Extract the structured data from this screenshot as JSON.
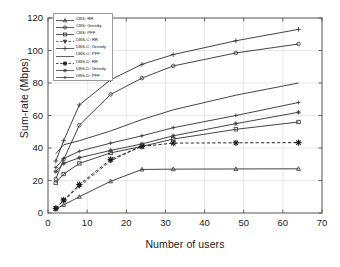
{
  "chart_data": {
    "type": "line",
    "title": "",
    "xlabel": "Number of users",
    "ylabel": "Sum-rate (Mbps)",
    "xlim": [
      0,
      70
    ],
    "ylim": [
      0,
      120
    ],
    "xticks": [
      0,
      10,
      20,
      30,
      40,
      50,
      60,
      70
    ],
    "yticks": [
      0,
      20,
      40,
      60,
      80,
      100,
      120
    ],
    "grid": true,
    "legend_position": "upper-left-inside",
    "series": [
      {
        "name": "CBS: RR",
        "marker": "triangle-up",
        "linestyle": "solid",
        "color": "#3a3a3a",
        "x": [
          2,
          4,
          8,
          16,
          24,
          32,
          48,
          64
        ],
        "y": [
          2.5,
          5.0,
          10.0,
          19.5,
          26.8,
          27.0,
          27.1,
          27.2
        ]
      },
      {
        "name": "CBS: Greedy",
        "marker": "circle",
        "linestyle": "solid",
        "color": "#3a3a3a",
        "x": [
          2,
          4,
          8,
          16,
          24,
          32,
          48,
          64
        ],
        "y": [
          21.0,
          33.0,
          54.0,
          73.0,
          83.0,
          90.5,
          98.5,
          104.0
        ]
      },
      {
        "name": "CBS: PFF",
        "marker": "square",
        "linestyle": "solid",
        "color": "#3a3a3a",
        "x": [
          2,
          4,
          8,
          16,
          24,
          32,
          48,
          64
        ],
        "y": [
          18.5,
          24.0,
          30.5,
          37.0,
          41.0,
          45.5,
          51.5,
          56.0
        ]
      },
      {
        "name": "DBS-C: RR",
        "marker": "triangle-down",
        "linestyle": "dashed",
        "color": "#3a3a3a",
        "x": [
          2,
          4,
          8,
          16,
          24
        ],
        "y": [
          3.0,
          7.5,
          16.5,
          32.0,
          41.5
        ]
      },
      {
        "name": "DBS-C: Greedy",
        "marker": "plus",
        "linestyle": "solid",
        "color": "#3a3a3a",
        "x": [
          2,
          4,
          8,
          16,
          24,
          32,
          48,
          64
        ],
        "y": [
          32.0,
          44.5,
          66.5,
          82.0,
          91.5,
          97.5,
          106.0,
          113.0
        ]
      },
      {
        "name": "DBS-C: PFF",
        "marker": "none",
        "linestyle": "solid",
        "color": "#3a3a3a",
        "x": [
          2,
          4,
          8,
          16,
          24,
          32,
          48,
          64
        ],
        "y": [
          36.5,
          42.0,
          44.5,
          50.5,
          57.5,
          63.5,
          72.5,
          80.0
        ]
      },
      {
        "name": "DBS-D: RR",
        "marker": "asterisk",
        "linestyle": "dashed",
        "color": "#1a1a1a",
        "x": [
          2,
          4,
          8,
          16,
          24,
          32,
          48,
          64
        ],
        "y": [
          2.8,
          8.0,
          17.5,
          33.0,
          41.0,
          43.0,
          43.2,
          43.3
        ]
      },
      {
        "name": "DBS-D: Greedy",
        "marker": "star",
        "linestyle": "solid",
        "color": "#3a3a3a",
        "x": [
          2,
          4,
          8,
          16,
          24,
          32,
          48,
          64
        ],
        "y": [
          25.5,
          30.5,
          34.0,
          38.5,
          42.5,
          47.5,
          55.0,
          62.0
        ]
      },
      {
        "name": "DBS-D: PFF",
        "marker": "plus-small",
        "linestyle": "solid",
        "color": "#3a3a3a",
        "x": [
          2,
          4,
          8,
          16,
          24,
          32,
          48,
          64
        ],
        "y": [
          28.0,
          33.5,
          38.0,
          43.0,
          47.5,
          52.5,
          60.0,
          68.0
        ]
      }
    ]
  },
  "axis": {
    "xlabel": "Number of users",
    "ylabel": "Sum-rate (Mbps)",
    "xticklabels": [
      "0",
      "10",
      "20",
      "30",
      "40",
      "50",
      "60",
      "70"
    ],
    "yticklabels": [
      "0",
      "20",
      "40",
      "60",
      "80",
      "100",
      "120"
    ]
  },
  "legend": {
    "items": [
      {
        "label": "CBS: RR"
      },
      {
        "label": "CBS: Greedy"
      },
      {
        "label": "CBS: PFF"
      },
      {
        "label": "DBS-C: RR"
      },
      {
        "label": "DBS-C: Greedy"
      },
      {
        "label": "DBS-C: PFF"
      },
      {
        "label": "DBS-D: RR"
      },
      {
        "label": "DBS-D: Greedy"
      },
      {
        "label": "DBS-D: PFF"
      }
    ]
  },
  "colors": {
    "axis": "#555555",
    "grid": "#d8d8d8",
    "line": "#3a3a3a",
    "background": "#ffffff"
  }
}
